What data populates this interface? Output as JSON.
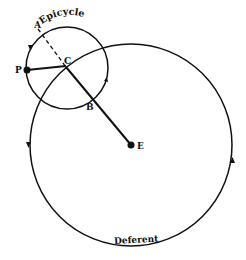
{
  "diagram": {
    "labels": {
      "epicycle": "Epicycle",
      "deferent": "Deferent",
      "point_a": "A",
      "point_b": "B",
      "point_c": "C",
      "point_p": "P",
      "point_e": "E"
    },
    "colors": {
      "stroke": "#111111",
      "background": "#ffffff"
    }
  }
}
